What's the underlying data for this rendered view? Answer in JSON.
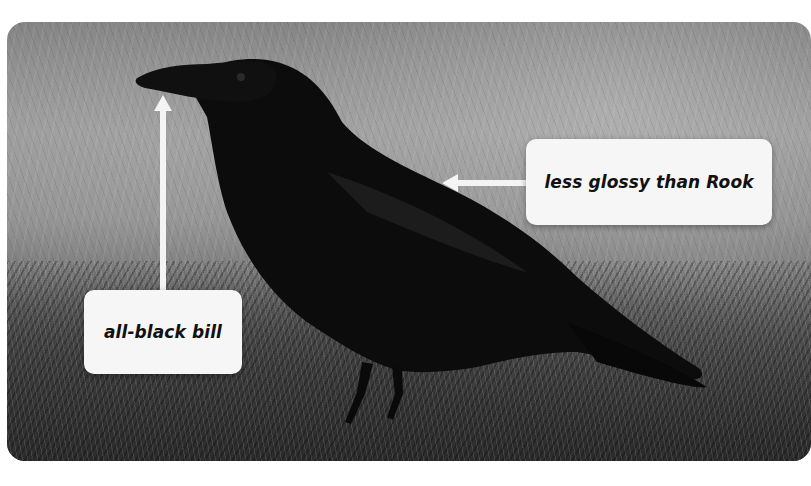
{
  "image": {
    "subject": "Carrion crow standing on grass",
    "style": "grayscale photograph with rounded corners"
  },
  "annotations": [
    {
      "id": "bill",
      "label": "all-black bill",
      "arrow_direction": "up",
      "points_to": "bill"
    },
    {
      "id": "plumage",
      "label": "less glossy than Rook",
      "arrow_direction": "left",
      "points_to": "back plumage"
    }
  ],
  "colors": {
    "label_background": "#f6f6f6",
    "label_text": "#111111",
    "arrow": "#f4f4f4",
    "bird": "#0c0c0c"
  }
}
